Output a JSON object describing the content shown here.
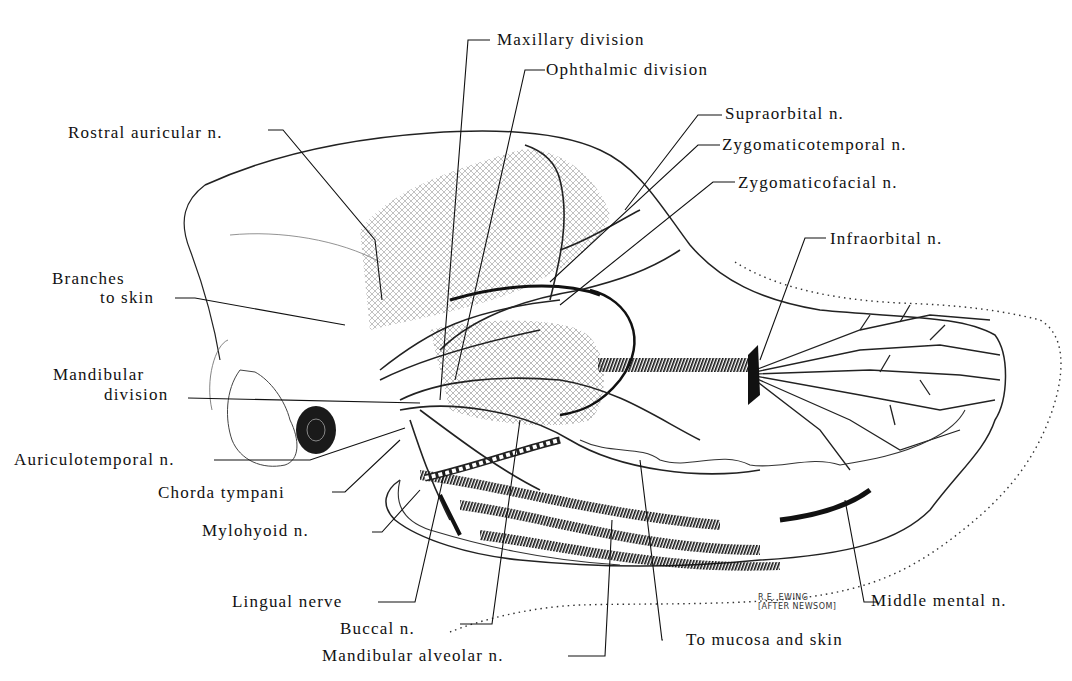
{
  "figure": {
    "signature": {
      "line1": "R.E. EWING",
      "line2": "[AFTER NEWSOM]"
    }
  },
  "labels": {
    "maxillary_division": "Maxillary division",
    "ophthalmic_division": "Ophthalmic division",
    "rostral_auricular": "Rostral auricular n.",
    "supraorbital": "Supraorbital n.",
    "zygomaticotemporal": "Zygomaticotemporal n.",
    "zygomaticofacial": "Zygomaticofacial n.",
    "infraorbital": "Infraorbital n.",
    "branches_to_skin_1": "Branches",
    "branches_to_skin_2": "to skin",
    "mandibular_division_1": "Mandibular",
    "mandibular_division_2": "division",
    "auriculotemporal": "Auriculotemporal n.",
    "chorda_tympani": "Chorda tympani",
    "mylohyoid": "Mylohyoid n.",
    "lingual_nerve": "Lingual nerve",
    "buccal": "Buccal n.",
    "mandibular_alveolar": "Mandibular alveolar n.",
    "to_mucosa_and_skin": "To mucosa and skin",
    "middle_mental": "Middle mental n."
  },
  "colors": {
    "ink": "#111111",
    "background": "#ffffff",
    "shading": "#555555"
  }
}
